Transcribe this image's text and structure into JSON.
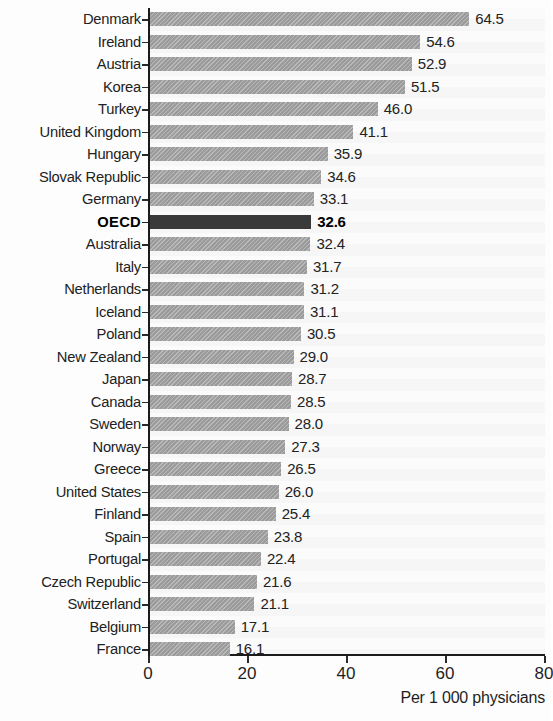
{
  "chart_data": {
    "type": "bar",
    "orientation": "horizontal",
    "title": "",
    "xlabel": "Per 1 000 physicians",
    "ylabel": "",
    "xlim": [
      0,
      80
    ],
    "xticks": [
      0,
      20,
      40,
      60,
      80
    ],
    "grid": false,
    "legend": false,
    "highlight_category": "OECD",
    "colors": {
      "bar": "#9b9b9b",
      "highlight_bar": "#3a3a3a",
      "axis": "#1b1b1b",
      "text": "#222222",
      "background": "#fdfdfd"
    },
    "categories": [
      "Denmark",
      "Ireland",
      "Austria",
      "Korea",
      "Turkey",
      "United Kingdom",
      "Hungary",
      "Slovak Republic",
      "Germany",
      "OECD",
      "Australia",
      "Italy",
      "Netherlands",
      "Iceland",
      "Poland",
      "New Zealand",
      "Japan",
      "Canada",
      "Sweden",
      "Norway",
      "Greece",
      "United States",
      "Finland",
      "Spain",
      "Portugal",
      "Czech Republic",
      "Switzerland",
      "Belgium",
      "France"
    ],
    "values": [
      64.5,
      54.6,
      52.9,
      51.5,
      46.0,
      41.1,
      35.9,
      34.6,
      33.1,
      32.6,
      32.4,
      31.7,
      31.2,
      31.1,
      30.5,
      29.0,
      28.7,
      28.5,
      28.0,
      27.3,
      26.5,
      26.0,
      25.4,
      23.8,
      22.4,
      21.6,
      21.1,
      17.1,
      16.1
    ],
    "value_labels": [
      "64.5",
      "54.6",
      "52.9",
      "51.5",
      "46.0",
      "41.1",
      "35.9",
      "34.6",
      "33.1",
      "32.6",
      "32.4",
      "31.7",
      "31.2",
      "31.1",
      "30.5",
      "29.0",
      "28.7",
      "28.5",
      "28.0",
      "27.3",
      "26.5",
      "26.0",
      "25.4",
      "23.8",
      "22.4",
      "21.6",
      "21.1",
      "17.1",
      "16.1"
    ],
    "xtick_labels": [
      "0",
      "20",
      "40",
      "60",
      "80"
    ]
  }
}
